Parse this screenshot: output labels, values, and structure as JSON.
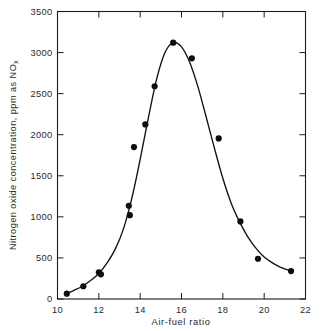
{
  "chart_data": {
    "type": "scatter",
    "title": "",
    "subtitle": "",
    "xlabel": "Air-fuel ratio",
    "ylabel": "Nitrogen oxide concentration, ppm as NO",
    "ylabel_subscript": "x",
    "xlim": [
      10,
      22
    ],
    "ylim": [
      0,
      3500
    ],
    "xticks": [
      10,
      12,
      14,
      16,
      18,
      20,
      22
    ],
    "xtick_labels": [
      "10",
      "12",
      "14",
      "16",
      "18",
      "20",
      "22"
    ],
    "yticks": [
      0,
      500,
      1000,
      1500,
      2000,
      2500,
      3000,
      3500
    ],
    "ytick_labels": [
      "0",
      "500",
      "1000",
      "1500",
      "2000",
      "2500",
      "3000",
      "3500"
    ],
    "grid": false,
    "legend": null,
    "marker": "filled-circle",
    "marker_color": "#0d0d0d",
    "curve_color": "#111111",
    "frame_color": "#1b1b1b",
    "background": "#ffffff",
    "x": [
      10.45,
      11.25,
      12.0,
      12.1,
      13.45,
      13.5,
      13.7,
      14.25,
      14.7,
      15.6,
      16.5,
      17.8,
      18.85,
      19.7,
      21.3
    ],
    "y": [
      65,
      155,
      325,
      300,
      1135,
      1020,
      1850,
      2125,
      2590,
      3120,
      2930,
      1955,
      945,
      490,
      340
    ],
    "series": [
      {
        "name": "NOx vs air-fuel ratio",
        "x": [
          10.45,
          11.25,
          12.0,
          12.1,
          13.45,
          13.5,
          13.7,
          14.25,
          14.7,
          15.6,
          16.5,
          17.8,
          18.85,
          19.7,
          21.3
        ],
        "values": [
          65,
          155,
          325,
          300,
          1135,
          1020,
          1850,
          2125,
          2590,
          3120,
          2930,
          1955,
          945,
          490,
          340
        ]
      }
    ],
    "fitted_curve": {
      "description": "smooth bell-shaped fit through data",
      "x": [
        10.4,
        10.8,
        11.2,
        11.6,
        12.0,
        12.4,
        12.8,
        13.2,
        13.6,
        14.0,
        14.4,
        14.8,
        15.2,
        15.6,
        16.0,
        16.4,
        16.8,
        17.2,
        17.6,
        18.0,
        18.4,
        18.8,
        19.2,
        19.6,
        20.0,
        20.4,
        20.8,
        21.3
      ],
      "y": [
        60,
        105,
        155,
        225,
        310,
        440,
        610,
        860,
        1230,
        1700,
        2210,
        2680,
        3000,
        3120,
        3070,
        2880,
        2580,
        2210,
        1830,
        1470,
        1170,
        945,
        760,
        620,
        510,
        440,
        385,
        340
      ]
    }
  }
}
